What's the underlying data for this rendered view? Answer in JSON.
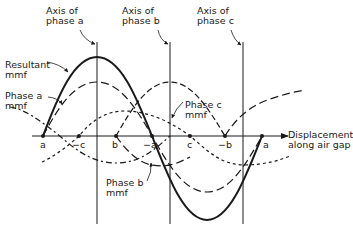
{
  "diagram": {
    "title": "",
    "axis_labels": {
      "phase_a": [
        "Axis of",
        "phase a"
      ],
      "phase_b": [
        "Axis of",
        "phase b"
      ],
      "phase_c": [
        "Axis of",
        "phase c"
      ]
    },
    "curve_labels": {
      "resultant": [
        "Resultant",
        "mmf"
      ],
      "phase_a": [
        "Phase a",
        "mmf"
      ],
      "phase_b": [
        "Phase b",
        "mmf"
      ],
      "phase_c": [
        "Phase c",
        "mmf"
      ]
    },
    "x_axis_label": [
      "Displacement",
      "along air gap"
    ],
    "points": [
      "a",
      "−c",
      "b",
      "−a",
      "c",
      "−b",
      "a"
    ],
    "colors": {
      "ink": "#1a1a1a",
      "background": "#ffffff"
    }
  }
}
